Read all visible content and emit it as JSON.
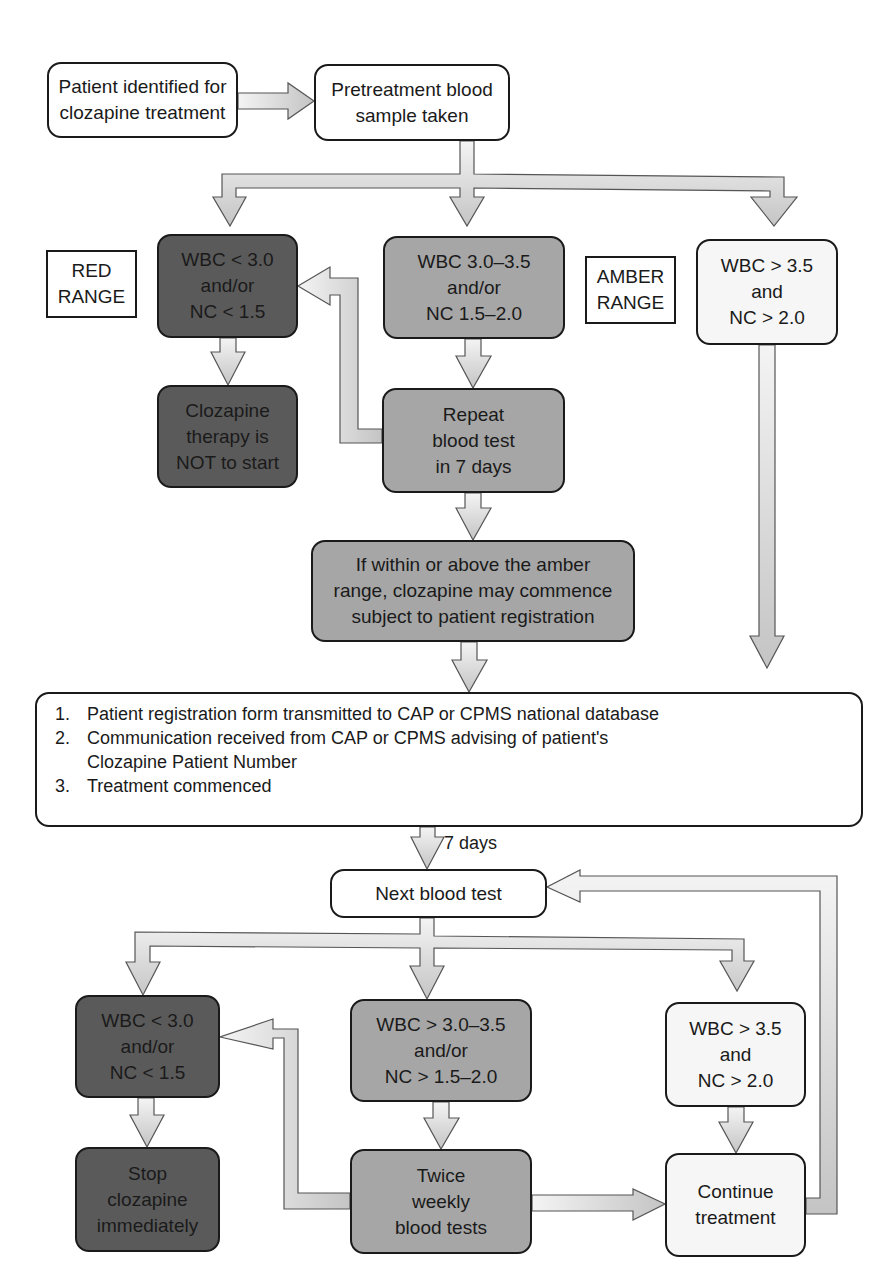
{
  "diagram": {
    "type": "flowchart",
    "start": {
      "patient_identified": [
        "Patient identified for",
        "clozapine treatment"
      ],
      "pretreatment": [
        "Pretreatment blood",
        "sample taken"
      ]
    },
    "range_labels": {
      "red": [
        "RED",
        "RANGE"
      ],
      "amber": [
        "AMBER",
        "RANGE"
      ]
    },
    "pretreatment_results": {
      "red": [
        "WBC < 3.0",
        "and/or",
        "NC < 1.5"
      ],
      "amber": [
        "WBC 3.0–3.5",
        "and/or",
        "NC 1.5–2.0"
      ],
      "green": [
        "WBC > 3.5",
        "and",
        "NC > 2.0"
      ]
    },
    "pretreatment_actions": {
      "red": [
        "Clozapine",
        "therapy is",
        "NOT to start"
      ],
      "amber": [
        "Repeat",
        "blood test",
        "in 7 days"
      ],
      "amber_followup": [
        "If within or above the amber",
        "range, clozapine may commence",
        "subject to patient registration"
      ]
    },
    "registration_steps": [
      {
        "num": "1.",
        "lines": [
          "Patient registration form transmitted to CAP or CPMS national database"
        ]
      },
      {
        "num": "2.",
        "lines": [
          "Communication received from CAP or CPMS advising of patient's",
          "Clozapine Patient Number"
        ]
      },
      {
        "num": "3.",
        "lines": [
          "Treatment commenced"
        ]
      }
    ],
    "interval_label": "7 days",
    "next_blood_test": "Next blood test",
    "monitoring_results": {
      "red": [
        "WBC < 3.0",
        "and/or",
        "NC < 1.5"
      ],
      "amber": [
        "WBC > 3.0–3.5",
        "and/or",
        "NC > 1.5–2.0"
      ],
      "green": [
        "WBC > 3.5",
        "and",
        "NC > 2.0"
      ]
    },
    "monitoring_actions": {
      "red": [
        "Stop",
        "clozapine",
        "immediately"
      ],
      "amber": [
        "Twice",
        "weekly",
        "blood tests"
      ],
      "green": [
        "Continue",
        "treatment"
      ]
    },
    "colors": {
      "red_fill": "#5a5a5a",
      "amber_fill": "#a6a6a6",
      "green_fill": "#f6f6f6",
      "arrow_fill": "#e2e2e2",
      "stroke": "#1a1a1a"
    }
  }
}
